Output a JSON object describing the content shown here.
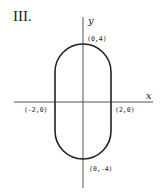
{
  "figure": {
    "numeral": "III.",
    "axes": {
      "x_label": "x",
      "y_label": "y"
    },
    "points": [
      {
        "label": "(0,4)",
        "x": 0,
        "y": 4
      },
      {
        "label": "(-2,0)",
        "x": -2,
        "y": 0
      },
      {
        "label": "(2,0)",
        "x": 2,
        "y": 0
      },
      {
        "label": "(0,-4)",
        "x": 0,
        "y": -4
      }
    ],
    "shape": "stadium (vertical capsule) with semicircular ends, straight sides at x=±2, extent y from -4 to 4",
    "colors": {
      "stroke": "#222222",
      "background": "#ffffff"
    }
  }
}
